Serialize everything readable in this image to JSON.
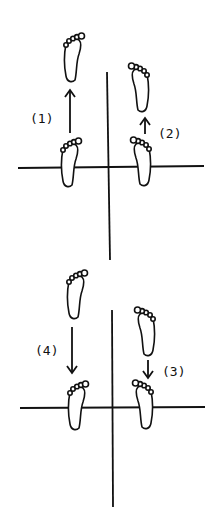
{
  "diagram": {
    "stroke_color": "#111111",
    "background": "#ffffff",
    "panels": [
      {
        "id": "top",
        "axes": {
          "vertical": {
            "x1": 107,
            "y1": 72,
            "x2": 110,
            "y2": 260
          },
          "horizontal": {
            "x1": 18,
            "y1": 168,
            "x2": 204,
            "y2": 166
          }
        },
        "steps": [
          {
            "label": "(1)",
            "label_x": 30,
            "label_y": 123,
            "direction": "up",
            "arrow": {
              "x": 70,
              "y_from": 133,
              "y_to": 90
            },
            "foot_from": {
              "x": 70,
              "y": 163,
              "mirror": false
            },
            "foot_to": {
              "x": 73,
              "y": 58,
              "mirror": false
            }
          },
          {
            "label": "(2)",
            "label_x": 158,
            "label_y": 138,
            "direction": "up",
            "arrow": {
              "x": 145,
              "y_from": 134,
              "y_to": 118
            },
            "foot_from": {
              "x": 142,
              "y": 162,
              "mirror": true
            },
            "foot_to": {
              "x": 140,
              "y": 88,
              "mirror": true
            }
          }
        ]
      },
      {
        "id": "bottom",
        "axes": {
          "vertical": {
            "x1": 112,
            "y1": 310,
            "x2": 113,
            "y2": 507
          },
          "horizontal": {
            "x1": 20,
            "y1": 408,
            "x2": 205,
            "y2": 407
          }
        },
        "steps": [
          {
            "label": "(4)",
            "label_x": 35,
            "label_y": 355,
            "direction": "down",
            "arrow": {
              "x": 72,
              "y_from": 327,
              "y_to": 373
            },
            "foot_from": {
              "x": 76,
              "y": 295,
              "mirror": false
            },
            "foot_to": {
              "x": 77,
              "y": 406,
              "mirror": false
            }
          },
          {
            "label": "(3)",
            "label_x": 162,
            "label_y": 376,
            "direction": "down",
            "arrow": {
              "x": 148,
              "y_from": 360,
              "y_to": 378
            },
            "foot_from": {
              "x": 146,
              "y": 332,
              "mirror": true
            },
            "foot_to": {
              "x": 144,
              "y": 405,
              "mirror": true
            }
          }
        ]
      }
    ]
  }
}
